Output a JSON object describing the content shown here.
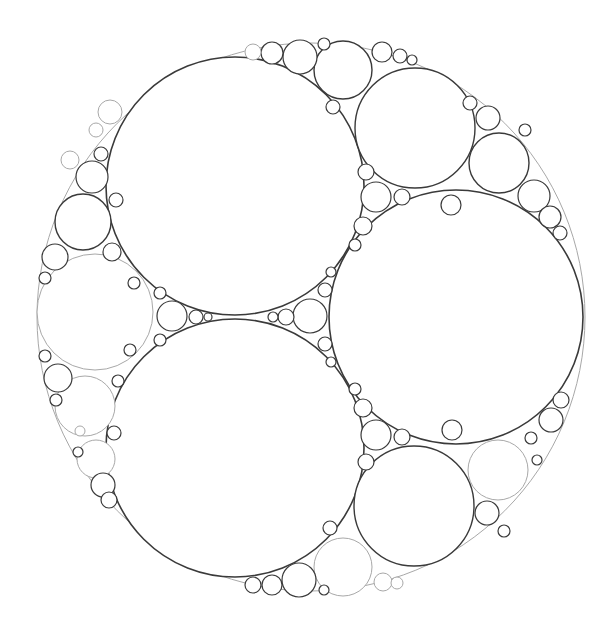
{
  "figure": {
    "title": "",
    "type": "apollonian-gasket",
    "width": 605,
    "height": 624,
    "background": "#ffffff",
    "stroke_dark": "#3a3a3a",
    "stroke_light": "#a8a8a8"
  },
  "outer_circle": {
    "cx": 311,
    "cy": 317,
    "r": 274,
    "tone": "light"
  },
  "circles": [
    {
      "id": "A-top-left-large",
      "cx": 235,
      "cy": 186,
      "r": 129,
      "tone": "dark"
    },
    {
      "id": "B-bottom-left-large",
      "cx": 235,
      "cy": 448,
      "r": 129,
      "tone": "dark"
    },
    {
      "id": "C-right-large",
      "cx": 456,
      "cy": 317,
      "r": 127,
      "tone": "dark"
    },
    {
      "id": "top-right-medium",
      "cx": 415,
      "cy": 128,
      "r": 60,
      "tone": "dark"
    },
    {
      "id": "bottom-right-medium",
      "cx": 414,
      "cy": 506,
      "r": 60,
      "tone": "dark"
    },
    {
      "id": "left-medium",
      "cx": 95,
      "cy": 312,
      "r": 58,
      "tone": "light"
    },
    {
      "id": "top-1",
      "cx": 343,
      "cy": 70,
      "r": 29,
      "tone": "dark"
    },
    {
      "id": "top-2",
      "cx": 300,
      "cy": 57,
      "r": 17,
      "tone": "dark"
    },
    {
      "id": "top-3",
      "cx": 272,
      "cy": 53,
      "r": 11,
      "tone": "dark"
    },
    {
      "id": "top-4",
      "cx": 324,
      "cy": 44,
      "r": 6,
      "tone": "dark"
    },
    {
      "id": "top-5",
      "cx": 253,
      "cy": 52,
      "r": 8,
      "tone": "light"
    },
    {
      "id": "top-6",
      "cx": 333,
      "cy": 107,
      "r": 7,
      "tone": "dark"
    },
    {
      "id": "top-7",
      "cx": 382,
      "cy": 52,
      "r": 10,
      "tone": "dark"
    },
    {
      "id": "top-8",
      "cx": 400,
      "cy": 56,
      "r": 7,
      "tone": "dark"
    },
    {
      "id": "top-9",
      "cx": 412,
      "cy": 60,
      "r": 5,
      "tone": "dark"
    },
    {
      "id": "bot-1",
      "cx": 343,
      "cy": 567,
      "r": 29,
      "tone": "light"
    },
    {
      "id": "bot-2",
      "cx": 299,
      "cy": 580,
      "r": 17,
      "tone": "dark"
    },
    {
      "id": "bot-3",
      "cx": 272,
      "cy": 585,
      "r": 10,
      "tone": "dark"
    },
    {
      "id": "bot-4",
      "cx": 253,
      "cy": 585,
      "r": 8,
      "tone": "dark"
    },
    {
      "id": "bot-5",
      "cx": 324,
      "cy": 590,
      "r": 5,
      "tone": "dark"
    },
    {
      "id": "bot-6",
      "cx": 330,
      "cy": 528,
      "r": 7,
      "tone": "dark"
    },
    {
      "id": "bot-7",
      "cx": 383,
      "cy": 582,
      "r": 9,
      "tone": "light"
    },
    {
      "id": "bot-8",
      "cx": 397,
      "cy": 583,
      "r": 6,
      "tone": "light"
    },
    {
      "id": "right-1",
      "cx": 499,
      "cy": 163,
      "r": 30,
      "tone": "dark"
    },
    {
      "id": "right-2",
      "cx": 534,
      "cy": 196,
      "r": 16,
      "tone": "dark"
    },
    {
      "id": "right-3",
      "cx": 550,
      "cy": 217,
      "r": 11,
      "tone": "dark"
    },
    {
      "id": "right-4",
      "cx": 560,
      "cy": 233,
      "r": 7,
      "tone": "dark"
    },
    {
      "id": "right-5",
      "cx": 488,
      "cy": 118,
      "r": 12,
      "tone": "dark"
    },
    {
      "id": "right-6",
      "cx": 470,
      "cy": 103,
      "r": 7,
      "tone": "dark"
    },
    {
      "id": "right-7",
      "cx": 525,
      "cy": 130,
      "r": 6,
      "tone": "dark"
    },
    {
      "id": "right-8",
      "cx": 451,
      "cy": 205,
      "r": 10,
      "tone": "dark"
    },
    {
      "id": "rightlow-1",
      "cx": 498,
      "cy": 470,
      "r": 30,
      "tone": "light"
    },
    {
      "id": "rightlow-2",
      "cx": 487,
      "cy": 513,
      "r": 12,
      "tone": "dark"
    },
    {
      "id": "rightlow-3",
      "cx": 551,
      "cy": 420,
      "r": 12,
      "tone": "dark"
    },
    {
      "id": "rightlow-4",
      "cx": 561,
      "cy": 400,
      "r": 8,
      "tone": "dark"
    },
    {
      "id": "rightlow-5",
      "cx": 531,
      "cy": 438,
      "r": 6,
      "tone": "dark"
    },
    {
      "id": "rightlow-6",
      "cx": 452,
      "cy": 430,
      "r": 10,
      "tone": "dark"
    },
    {
      "id": "rightlow-7",
      "cx": 504,
      "cy": 531,
      "r": 6,
      "tone": "dark"
    },
    {
      "id": "rightlow-8",
      "cx": 537,
      "cy": 460,
      "r": 5,
      "tone": "dark"
    },
    {
      "id": "gap-AC-1",
      "cx": 376,
      "cy": 197,
      "r": 15,
      "tone": "dark"
    },
    {
      "id": "gap-AC-2",
      "cx": 402,
      "cy": 197,
      "r": 8,
      "tone": "dark"
    },
    {
      "id": "gap-AC-3",
      "cx": 366,
      "cy": 172,
      "r": 8,
      "tone": "dark"
    },
    {
      "id": "gap-AC-4",
      "cx": 363,
      "cy": 226,
      "r": 9,
      "tone": "dark"
    },
    {
      "id": "gap-AC-5",
      "cx": 355,
      "cy": 245,
      "r": 6,
      "tone": "dark"
    },
    {
      "id": "gap-BC-1",
      "cx": 376,
      "cy": 435,
      "r": 15,
      "tone": "dark"
    },
    {
      "id": "gap-BC-2",
      "cx": 402,
      "cy": 437,
      "r": 8,
      "tone": "dark"
    },
    {
      "id": "gap-BC-3",
      "cx": 366,
      "cy": 462,
      "r": 8,
      "tone": "dark"
    },
    {
      "id": "gap-BC-4",
      "cx": 363,
      "cy": 408,
      "r": 9,
      "tone": "dark"
    },
    {
      "id": "gap-BC-5",
      "cx": 355,
      "cy": 389,
      "r": 6,
      "tone": "dark"
    },
    {
      "id": "center-1",
      "cx": 310,
      "cy": 316,
      "r": 17,
      "tone": "dark"
    },
    {
      "id": "center-2",
      "cx": 286,
      "cy": 317,
      "r": 8,
      "tone": "dark"
    },
    {
      "id": "center-3",
      "cx": 273,
      "cy": 317,
      "r": 5,
      "tone": "dark"
    },
    {
      "id": "center-4",
      "cx": 325,
      "cy": 290,
      "r": 7,
      "tone": "dark"
    },
    {
      "id": "center-5",
      "cx": 325,
      "cy": 344,
      "r": 7,
      "tone": "dark"
    },
    {
      "id": "center-6",
      "cx": 331,
      "cy": 272,
      "r": 5,
      "tone": "dark"
    },
    {
      "id": "center-7",
      "cx": 331,
      "cy": 362,
      "r": 5,
      "tone": "dark"
    },
    {
      "id": "gap-left-1",
      "cx": 172,
      "cy": 316,
      "r": 15,
      "tone": "dark"
    },
    {
      "id": "gap-left-2",
      "cx": 196,
      "cy": 317,
      "r": 7,
      "tone": "dark"
    },
    {
      "id": "gap-left-3",
      "cx": 208,
      "cy": 317,
      "r": 4,
      "tone": "dark"
    },
    {
      "id": "gap-left-4",
      "cx": 160,
      "cy": 293,
      "r": 6,
      "tone": "dark"
    },
    {
      "id": "gap-left-5",
      "cx": 160,
      "cy": 340,
      "r": 6,
      "tone": "dark"
    },
    {
      "id": "left-1",
      "cx": 83,
      "cy": 222,
      "r": 28,
      "tone": "dark"
    },
    {
      "id": "left-2",
      "cx": 92,
      "cy": 177,
      "r": 16,
      "tone": "dark"
    },
    {
      "id": "left-3",
      "cx": 55,
      "cy": 257,
      "r": 13,
      "tone": "dark"
    },
    {
      "id": "left-4",
      "cx": 112,
      "cy": 252,
      "r": 9,
      "tone": "dark"
    },
    {
      "id": "left-5",
      "cx": 101,
      "cy": 154,
      "r": 7,
      "tone": "dark"
    },
    {
      "id": "left-6",
      "cx": 70,
      "cy": 160,
      "r": 9,
      "tone": "light"
    },
    {
      "id": "left-7",
      "cx": 110,
      "cy": 112,
      "r": 12,
      "tone": "light"
    },
    {
      "id": "left-8",
      "cx": 96,
      "cy": 130,
      "r": 7,
      "tone": "light"
    },
    {
      "id": "left-9",
      "cx": 45,
      "cy": 278,
      "r": 6,
      "tone": "dark"
    },
    {
      "id": "left-10",
      "cx": 116,
      "cy": 200,
      "r": 7,
      "tone": "dark"
    },
    {
      "id": "left-11",
      "cx": 134,
      "cy": 283,
      "r": 6,
      "tone": "dark"
    },
    {
      "id": "leftlow-1",
      "cx": 85,
      "cy": 406,
      "r": 30,
      "tone": "light"
    },
    {
      "id": "leftlow-2",
      "cx": 58,
      "cy": 378,
      "r": 14,
      "tone": "dark"
    },
    {
      "id": "leftlow-3",
      "cx": 96,
      "cy": 459,
      "r": 19,
      "tone": "light"
    },
    {
      "id": "leftlow-4",
      "cx": 103,
      "cy": 485,
      "r": 12,
      "tone": "dark"
    },
    {
      "id": "leftlow-5",
      "cx": 109,
      "cy": 500,
      "r": 8,
      "tone": "dark"
    },
    {
      "id": "leftlow-6",
      "cx": 45,
      "cy": 356,
      "r": 6,
      "tone": "dark"
    },
    {
      "id": "leftlow-7",
      "cx": 56,
      "cy": 400,
      "r": 6,
      "tone": "dark"
    },
    {
      "id": "leftlow-8",
      "cx": 118,
      "cy": 381,
      "r": 6,
      "tone": "dark"
    },
    {
      "id": "leftlow-9",
      "cx": 114,
      "cy": 433,
      "r": 7,
      "tone": "dark"
    },
    {
      "id": "leftlow-10",
      "cx": 130,
      "cy": 350,
      "r": 6,
      "tone": "dark"
    },
    {
      "id": "leftlow-11",
      "cx": 80,
      "cy": 431,
      "r": 5,
      "tone": "light"
    },
    {
      "id": "leftlow-12",
      "cx": 78,
      "cy": 452,
      "r": 5,
      "tone": "dark"
    }
  ]
}
